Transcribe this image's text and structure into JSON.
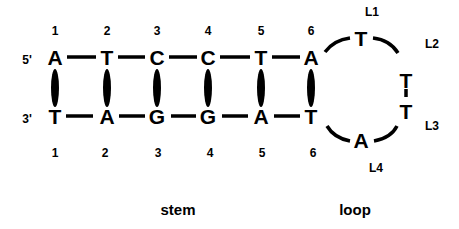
{
  "diagram": {
    "type": "DNA hairpin (stem-loop) schematic",
    "strand_top": {
      "end_label": "5'",
      "bases": [
        "A",
        "T",
        "C",
        "C",
        "T",
        "A"
      ],
      "positions": [
        "1",
        "2",
        "3",
        "4",
        "5",
        "6"
      ]
    },
    "strand_bottom": {
      "end_label": "3'",
      "bases": [
        "T",
        "A",
        "G",
        "G",
        "A",
        "T"
      ],
      "positions": [
        "1",
        "2",
        "3",
        "4",
        "5",
        "6"
      ]
    },
    "base_pairs": [
      {
        "top": "A",
        "bottom": "T",
        "position": "1"
      },
      {
        "top": "T",
        "bottom": "A",
        "position": "2"
      },
      {
        "top": "C",
        "bottom": "G",
        "position": "3"
      },
      {
        "top": "C",
        "bottom": "G",
        "position": "4"
      },
      {
        "top": "T",
        "bottom": "A",
        "position": "5"
      },
      {
        "top": "A",
        "bottom": "T",
        "position": "6"
      }
    ],
    "loop": [
      {
        "label": "L1",
        "base": "T"
      },
      {
        "label": "L2",
        "base": "T"
      },
      {
        "label": "L3",
        "base": "T"
      },
      {
        "label": "L4",
        "base": "A"
      }
    ],
    "section_labels": {
      "stem": "stem",
      "loop": "loop"
    }
  }
}
